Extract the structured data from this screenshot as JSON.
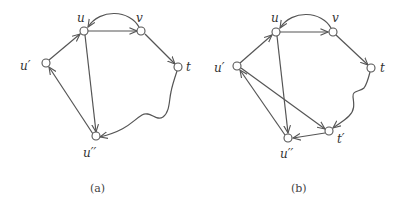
{
  "figures": [
    {
      "caption": "(a)",
      "nodes": [
        {
          "id": "u",
          "label": "u"
        },
        {
          "id": "v",
          "label": "v"
        },
        {
          "id": "t",
          "label": "t"
        },
        {
          "id": "u1",
          "label": "u′"
        },
        {
          "id": "u2",
          "label": "u′′"
        }
      ],
      "edges": [
        {
          "from": "u",
          "to": "v",
          "style": "straight"
        },
        {
          "from": "v",
          "to": "u",
          "style": "arc"
        },
        {
          "from": "v",
          "to": "t",
          "style": "straight"
        },
        {
          "from": "t",
          "to": "u2",
          "style": "wavy-path"
        },
        {
          "from": "u",
          "to": "u2",
          "style": "straight"
        },
        {
          "from": "u2",
          "to": "u1",
          "style": "straight"
        },
        {
          "from": "u1",
          "to": "u",
          "style": "straight"
        }
      ]
    },
    {
      "caption": "(b)",
      "nodes": [
        {
          "id": "u",
          "label": "u"
        },
        {
          "id": "v",
          "label": "v"
        },
        {
          "id": "t",
          "label": "t"
        },
        {
          "id": "u1",
          "label": "u′"
        },
        {
          "id": "u2",
          "label": "u′′"
        },
        {
          "id": "t1",
          "label": "t′"
        }
      ],
      "edges": [
        {
          "from": "u",
          "to": "v",
          "style": "straight"
        },
        {
          "from": "v",
          "to": "u",
          "style": "arc"
        },
        {
          "from": "v",
          "to": "t",
          "style": "straight"
        },
        {
          "from": "t",
          "to": "t1",
          "style": "wavy-path"
        },
        {
          "from": "u1",
          "to": "t1",
          "style": "straight"
        },
        {
          "from": "t1",
          "to": "u2",
          "style": "straight"
        },
        {
          "from": "u",
          "to": "u2",
          "style": "straight"
        },
        {
          "from": "u2",
          "to": "u1",
          "style": "straight"
        },
        {
          "from": "u1",
          "to": "u",
          "style": "straight"
        }
      ]
    }
  ]
}
